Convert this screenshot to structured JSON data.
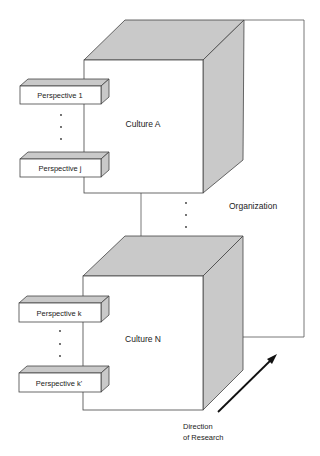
{
  "diagram": {
    "cubes": [
      {
        "id": "culture-a",
        "label": "Culture A"
      },
      {
        "id": "culture-n",
        "label": "Culture N"
      }
    ],
    "perspectives": [
      {
        "label": "Perspective 1"
      },
      {
        "label": "Perspective j"
      },
      {
        "label": "Perspective k"
      },
      {
        "label": "Perspective k'"
      }
    ],
    "organization_label": "Organization",
    "direction_label_line1": "Direction",
    "direction_label_line2": "of Research",
    "colors": {
      "shade": "#c9c9c9",
      "stroke": "#444444",
      "background": "#ffffff"
    }
  }
}
